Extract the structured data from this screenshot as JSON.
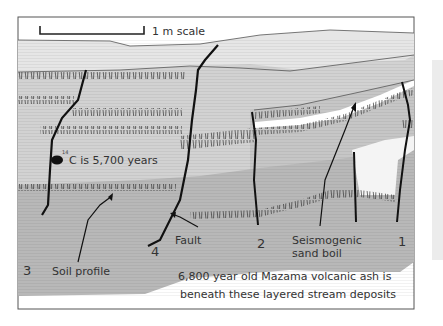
{
  "figure": {
    "scale_label": "1 m scale",
    "dating_label_superscript": "14",
    "dating_label_text": "C is 5,700 years",
    "labels": {
      "soil_profile": "Soil profile",
      "fault": "Fault",
      "sand_boil_line1": "Seismogenic",
      "sand_boil_line2": "sand boil",
      "fault_1": "1",
      "fault_2": "2",
      "fault_3": "3",
      "fault_4": "4"
    },
    "caption_line1": "6,800 year old Mazama volcanic ash is",
    "caption_line2": "beneath these layered stream deposits"
  },
  "colors": {
    "border": "#555555",
    "top_layer": "#e6e6e6",
    "upper_layer": "#d2d2d2",
    "mid_layer": "#c4c4c4",
    "lower_layer": "#b4b4b4",
    "sand": "#ffffff",
    "ink": "#111111",
    "label": "#333333"
  }
}
